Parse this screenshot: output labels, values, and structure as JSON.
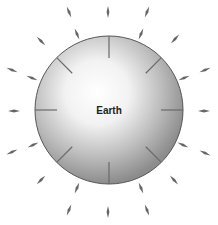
{
  "diagram": {
    "planet_label": "Earth",
    "center": [
      109,
      110
    ],
    "radius": 74,
    "colors": {
      "sphere_highlight": "#ffffff",
      "sphere_mid": "#d0d0d0",
      "sphere_edge": "#8a8a8a",
      "outline": "#555555",
      "arrow": "#666666"
    },
    "outer_arrows": [
      {
        "x": 108,
        "y": 12,
        "angle": 90
      },
      {
        "x": 69,
        "y": 12,
        "angle": 70
      },
      {
        "x": 147,
        "y": 12,
        "angle": 110
      },
      {
        "x": 77,
        "y": 34,
        "angle": 65
      },
      {
        "x": 141,
        "y": 34,
        "angle": 115
      },
      {
        "x": 41,
        "y": 41,
        "angle": 42
      },
      {
        "x": 175,
        "y": 39,
        "angle": 138
      },
      {
        "x": 32,
        "y": 78,
        "angle": 22
      },
      {
        "x": 184,
        "y": 78,
        "angle": 158
      },
      {
        "x": 12,
        "y": 70,
        "angle": 20
      },
      {
        "x": 205,
        "y": 70,
        "angle": 160
      },
      {
        "x": 14,
        "y": 111,
        "angle": 0
      },
      {
        "x": 204,
        "y": 111,
        "angle": 180
      },
      {
        "x": 33,
        "y": 145,
        "angle": -22
      },
      {
        "x": 183,
        "y": 145,
        "angle": -158
      },
      {
        "x": 12,
        "y": 152,
        "angle": -20
      },
      {
        "x": 205,
        "y": 153,
        "angle": -160
      },
      {
        "x": 41,
        "y": 180,
        "angle": -42
      },
      {
        "x": 174,
        "y": 180,
        "angle": -138
      },
      {
        "x": 77,
        "y": 188,
        "angle": -65
      },
      {
        "x": 141,
        "y": 188,
        "angle": -115
      },
      {
        "x": 69,
        "y": 210,
        "angle": -70
      },
      {
        "x": 147,
        "y": 210,
        "angle": -110
      },
      {
        "x": 108,
        "y": 212,
        "angle": -90
      }
    ],
    "inner_lines": [
      {
        "angle": 90
      },
      {
        "angle": 45
      },
      {
        "angle": 0
      },
      {
        "angle": -45
      },
      {
        "angle": -90
      },
      {
        "angle": -135
      },
      {
        "angle": 180
      },
      {
        "angle": 135
      }
    ]
  }
}
